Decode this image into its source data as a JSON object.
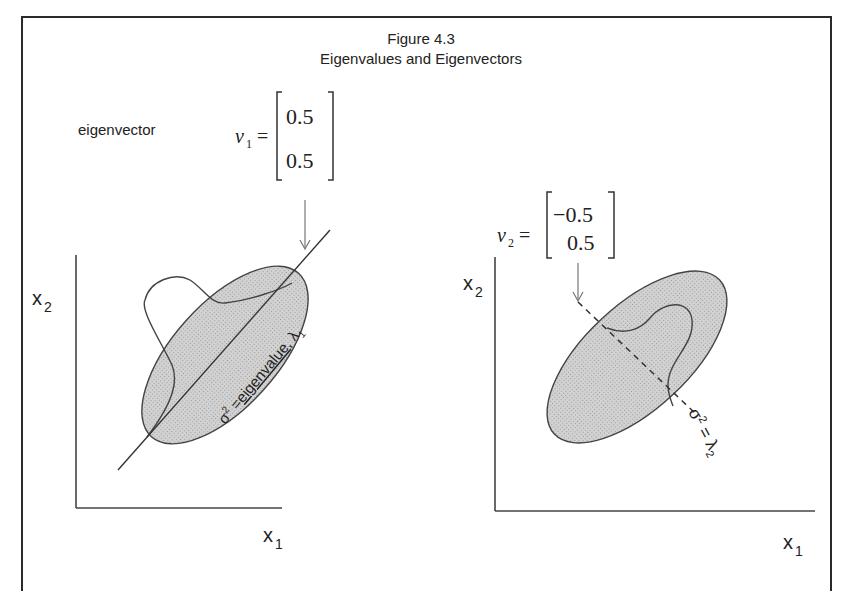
{
  "figure": {
    "title": "Figure 4.3",
    "subtitle": "Eigenvalues and Eigenvectors"
  },
  "left_panel": {
    "label": "eigenvector",
    "vector_name": "v",
    "vector_sub": "1",
    "equals": "=",
    "vector_values": [
      "0.5",
      "0.5"
    ],
    "y_axis_label": "x",
    "y_axis_sub": "2",
    "x_axis_label": "x",
    "x_axis_sub": "1",
    "annotation_prefix": "σ",
    "annotation_sup": "2",
    "annotation_eq": " =",
    "annotation_word": "eigenvalue",
    "annotation_suffix": ", λ",
    "annotation_sub": "1"
  },
  "right_panel": {
    "vector_name": "v",
    "vector_sub": "2",
    "equals": "=",
    "vector_values": [
      "−0.5",
      "0.5"
    ],
    "y_axis_label": "x",
    "y_axis_sub": "2",
    "x_axis_label": "x",
    "x_axis_sub": "1",
    "annotation_prefix": "σ",
    "annotation_sup": "2",
    "annotation_eq": " = λ",
    "annotation_sub": "2"
  },
  "colors": {
    "ellipse_fill": "#c8c8c8",
    "stroke": "#333333",
    "frame": "#2a2a2a"
  }
}
